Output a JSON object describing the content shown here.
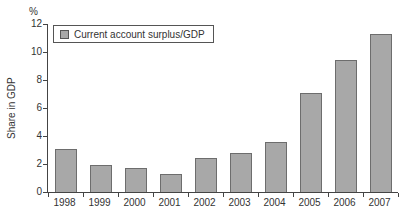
{
  "chart": {
    "unit_label": "%",
    "y_axis_title": "Share in GDP",
    "legend": {
      "label": "Current account surplus/GDP"
    },
    "colors": {
      "bar_fill": "#a8a8a8",
      "bar_border": "#6d6d6d",
      "axis": "#444444",
      "text": "#333333",
      "legend_border": "#555555",
      "background": "#ffffff"
    }
  },
  "chart_data": {
    "type": "bar",
    "title": "",
    "series_name": "Current account surplus/GDP",
    "categories": [
      "1998",
      "1999",
      "2000",
      "2001",
      "2002",
      "2003",
      "2004",
      "2005",
      "2006",
      "2007"
    ],
    "values": [
      3.1,
      1.9,
      1.7,
      1.3,
      2.4,
      2.8,
      3.6,
      7.1,
      9.4,
      11.3
    ],
    "xlabel": "",
    "ylabel": "Share in GDP",
    "unit": "%",
    "ylim": [
      0,
      12
    ],
    "yticks": [
      0,
      2,
      4,
      6,
      8,
      10,
      12
    ],
    "grid": false,
    "legend_position": "top-left-inside"
  }
}
